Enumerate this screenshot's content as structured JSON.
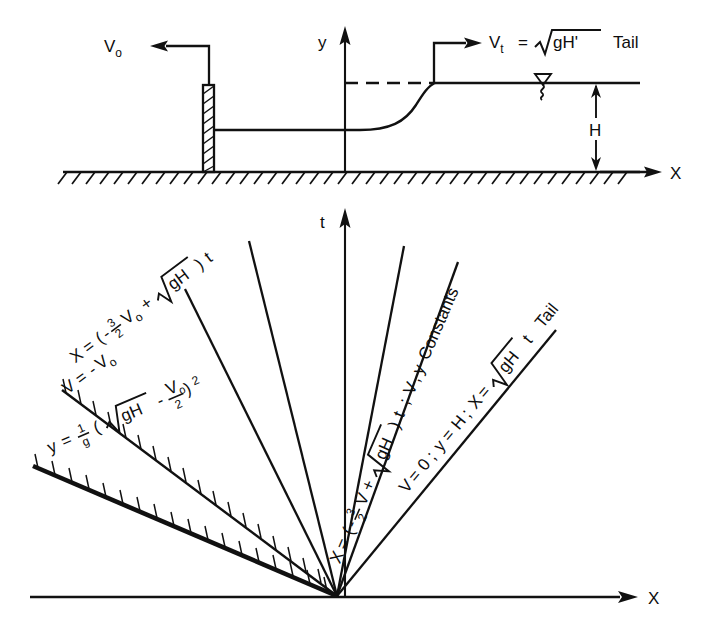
{
  "figure": {
    "ink_color": "#111111",
    "background": "#ffffff"
  },
  "upper_diagram": {
    "name": "definition-sketch",
    "axes": {
      "y_axis_label": "y",
      "x_axis_label": "X"
    },
    "labels": {
      "v0": "V",
      "v0_sub": "o",
      "vt": "V",
      "vt_sub": "t",
      "equals": "=",
      "vt_radicand": "gH'",
      "tail": "Tail",
      "depth": "H"
    },
    "elements": {
      "dam_name": "dam-gate",
      "ground_name": "ground-hatching",
      "water_surface_name": "water-surface-profile",
      "tailwater_name": "tailwater-level-line",
      "dashed_name": "dashed-reference-level",
      "wse_symbol_name": "water-surface-elevation-symbol"
    }
  },
  "lower_diagram": {
    "name": "x-t-characteristics-diagram",
    "axes": {
      "t_axis_label": "t",
      "x_axis_label": "X"
    },
    "labels": {
      "negative_characteristic_x": "X = (- 3⁄2 V₀ + √gH ) t",
      "negative_characteristic_v": "V = -V₀",
      "free_surface_y": "y = 1⁄g ( √gH - V₀⁄2 )²",
      "general_characteristic": "X = (- 3⁄2 V + √gH ) t ; V, y Constants",
      "tail_characteristic": "V = 0 ; y = H ; X = √gH  t",
      "tail_word": "Tail"
    },
    "pieces": {
      "x_label": "X",
      "t_label": "t",
      "three": "3",
      "two": "2",
      "v_sym": "V",
      "v_sub_o": "o",
      "g_sym": "g",
      "H_sym": "H",
      "y_sym": "y",
      "one": "1",
      "zero": "0",
      "constants": "Constants",
      "t_var": "t",
      "eq": "=",
      "semi": ";",
      "comma": ","
    },
    "fan_lines_count": 7,
    "apex": {
      "x": 337,
      "y": 596
    }
  }
}
